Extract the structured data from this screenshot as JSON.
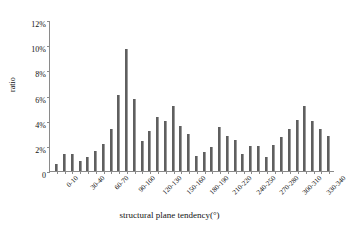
{
  "chart_data": {
    "type": "bar",
    "title": "",
    "xlabel": "structural plane tendency(°)",
    "ylabel": "ratio",
    "ylim": [
      0,
      12
    ],
    "ytick_labels": [
      "0",
      "2%",
      "4%",
      "6%",
      "8%",
      "10%",
      "12%"
    ],
    "ytick_values": [
      0,
      2,
      4,
      6,
      8,
      10,
      12
    ],
    "grid": false,
    "legend": null,
    "bar_color": "#5f5f5f",
    "categories": [
      "0-10",
      "10-20",
      "20-30",
      "30-40",
      "40-50",
      "50-60",
      "60-70",
      "70-80",
      "80-90",
      "90-100",
      "100-110",
      "110-120",
      "120-130",
      "130-140",
      "140-150",
      "150-160",
      "160-170",
      "170-180",
      "180-190",
      "190-200",
      "200-210",
      "210-220",
      "220-230",
      "230-240",
      "240-250",
      "250-260",
      "260-270",
      "270-280",
      "280-290",
      "290-300",
      "300-310",
      "310-320",
      "320-330",
      "330-340",
      "340-350",
      "350-360"
    ],
    "values": [
      0.6,
      1.4,
      1.4,
      0.8,
      1.1,
      1.6,
      2.2,
      3.4,
      6.1,
      9.8,
      5.8,
      2.4,
      3.2,
      4.3,
      4.0,
      5.2,
      3.6,
      3.0,
      1.2,
      1.5,
      1.9,
      3.5,
      2.8,
      2.5,
      1.4,
      2.0,
      2.0,
      1.1,
      2.1,
      2.7,
      3.4,
      4.1,
      5.2,
      4.0,
      3.4,
      2.8
    ],
    "xtick_labels_shown": [
      "0-10",
      "30-40",
      "60-70",
      "90-100",
      "120-130",
      "150-160",
      "180-190",
      "210-220",
      "240-250",
      "270-280",
      "300-310",
      "330-340"
    ],
    "xtick_label_indices": [
      0,
      3,
      6,
      9,
      12,
      15,
      18,
      21,
      24,
      27,
      30,
      33
    ]
  }
}
